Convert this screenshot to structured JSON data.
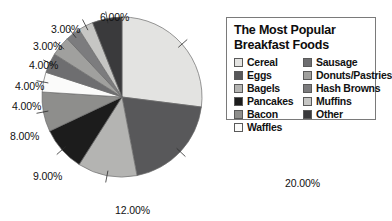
{
  "legend": {
    "title_line1": "The Most Popular",
    "title_line2": "Breakfast Foods",
    "column_left": [
      {
        "label": "Cereal",
        "color": "#e3e3e1"
      },
      {
        "label": "Eggs",
        "color": "#58585a"
      },
      {
        "label": "Bagels",
        "color": "#b4b4b2"
      },
      {
        "label": "Pancakes",
        "color": "#1c1c1c"
      },
      {
        "label": "Bacon",
        "color": "#8e8e8c"
      },
      {
        "label": "Waffles",
        "color": "#fbfbfa"
      }
    ],
    "column_right": [
      {
        "label": "Sausage",
        "color": "#6e6e70"
      },
      {
        "label": "Donuts/Pastries",
        "color": "#a0a09e"
      },
      {
        "label": "Hash Browns",
        "color": "#7c7c7e"
      },
      {
        "label": "Muffins",
        "color": "#c6c6c4"
      },
      {
        "label": "Other",
        "color": "#3a3a3c"
      }
    ]
  },
  "labels": [
    {
      "text": "27.00%",
      "x": 313,
      "y": 36,
      "anchor": "start"
    },
    {
      "text": "20.00%",
      "x": 285,
      "y": 178,
      "anchor": "start"
    },
    {
      "text": "12.00%",
      "x": 115,
      "y": 205,
      "anchor": "start"
    },
    {
      "text": "9.00%",
      "x": 33,
      "y": 171,
      "anchor": "start"
    },
    {
      "text": "8.00%",
      "x": 10,
      "y": 131,
      "anchor": "start"
    },
    {
      "text": "4.00%",
      "x": 12,
      "y": 101,
      "anchor": "start"
    },
    {
      "text": "4.00%",
      "x": 15,
      "y": 81,
      "anchor": "start"
    },
    {
      "text": "4.00%",
      "x": 29,
      "y": 60,
      "anchor": "start"
    },
    {
      "text": "3.00%",
      "x": 33,
      "y": 41,
      "anchor": "start"
    },
    {
      "text": "3.00%",
      "x": 51,
      "y": 24,
      "anchor": "start"
    },
    {
      "text": "6.00%",
      "x": 100,
      "y": 12,
      "anchor": "start"
    }
  ],
  "chart_data": {
    "type": "pie",
    "title": "The Most Popular Breakfast Foods",
    "xlabel": "",
    "ylabel": "",
    "legend_position": "right",
    "grid": false,
    "value_format": "percent",
    "start_angle_deg": 0,
    "direction": "clockwise",
    "categories": [
      "Cereal",
      "Eggs",
      "Bagels",
      "Pancakes",
      "Bacon",
      "Waffles",
      "Sausage",
      "Donuts/Pastries",
      "Hash Browns",
      "Muffins",
      "Other"
    ],
    "values": [
      27,
      20,
      12,
      9,
      8,
      4,
      4,
      4,
      3,
      3,
      6
    ],
    "value_labels": [
      "27.00%",
      "20.00%",
      "12.00%",
      "9.00%",
      "8.00%",
      "4.00%",
      "4.00%",
      "4.00%",
      "3.00%",
      "3.00%",
      "6.00%"
    ],
    "colors": [
      "#e3e3e1",
      "#58585a",
      "#b4b4b2",
      "#1c1c1c",
      "#8e8e8c",
      "#fbfbfa",
      "#6e6e70",
      "#a0a09e",
      "#7c7c7e",
      "#c6c6c4",
      "#3a3a3c"
    ],
    "total": 100
  },
  "geometry": {
    "cx": 122,
    "cy": 97,
    "r": 80
  }
}
